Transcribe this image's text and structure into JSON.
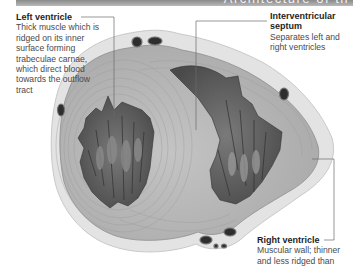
{
  "header": {
    "title": "Architecture of th",
    "bar_color_top": "#8a8a8a",
    "bar_color_bottom": "#b9b9b9"
  },
  "figure": {
    "style": "grayscale anatomical illustration",
    "colors": {
      "myocardium": "#b7b7b7",
      "myocardium_lines": "#9a9a9a",
      "cavity": "#5e5e5e",
      "trabeculae_dark": "#3f3f3f",
      "fat_layer": "#e3e3e3",
      "vessel": "#2e2e2e",
      "leader_line": "#6a6a6a"
    }
  },
  "labels": {
    "left_ventricle": {
      "title": "Left ventricle",
      "description": "Thick muscle which is ridged on its inner surface forming trabeculae carnae, which direct blood towards the outflow tract"
    },
    "septum": {
      "title": "Interventricular septum",
      "description": "Separates left and right ventricles"
    },
    "right_ventricle": {
      "title": "Right ventricle",
      "description": "Muscular wall; thinner and less ridged than"
    }
  }
}
